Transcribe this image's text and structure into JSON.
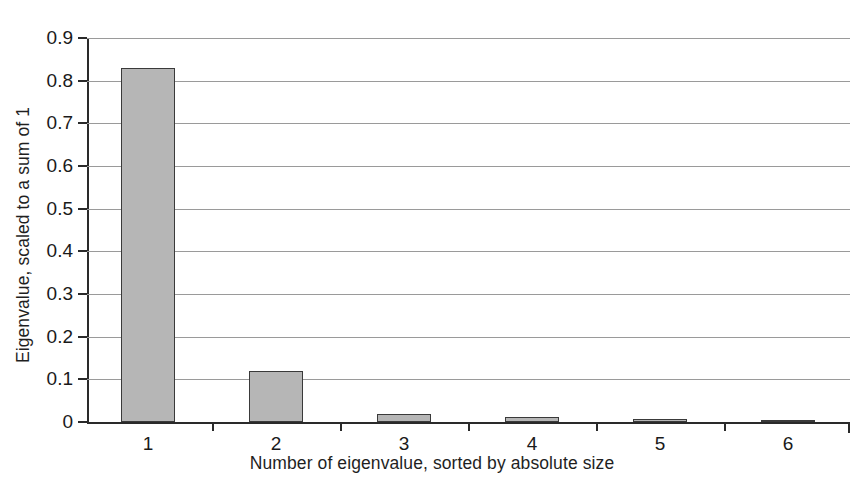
{
  "chart_data": {
    "type": "bar",
    "title": "",
    "xlabel": "Number of eigenvalue, sorted by absolute size",
    "ylabel": "Eigenvalue, scaled to a sum of 1",
    "categories": [
      "1",
      "2",
      "3",
      "4",
      "5",
      "6"
    ],
    "values": [
      0.83,
      0.12,
      0.018,
      0.012,
      0.006,
      0.003
    ],
    "ylim": [
      0,
      0.9
    ],
    "ytick_labels": [
      "0",
      "0.1",
      "0.2",
      "0.3",
      "0.4",
      "0.5",
      "0.6",
      "0.7",
      "0.8",
      "0.9"
    ],
    "ytick_values": [
      0,
      0.1,
      0.2,
      0.3,
      0.4,
      0.5,
      0.6,
      0.7,
      0.8,
      0.9
    ],
    "grid": true,
    "legend": null,
    "bar_fill_color": "#b6b6b6",
    "bar_edge_color": "#3a3a3a",
    "axis_color": "#2a2a2a",
    "grid_color": "#9a9a9a"
  },
  "figure": {
    "cropped_top_text": ""
  }
}
